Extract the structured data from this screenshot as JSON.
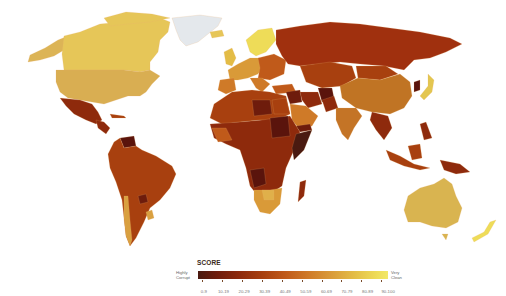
{
  "map": {
    "type": "choropleth",
    "subject": "Corruption score by country (world map)",
    "colors": {
      "0-9": "#4a1a10",
      "10-19": "#6e1c0c",
      "20-29": "#8e2a0c",
      "30-39": "#a8400f",
      "40-49": "#c05a1a",
      "50-59": "#cf7a28",
      "60-69": "#d99a38",
      "70-79": "#e3bc46",
      "80-89": "#eedc58",
      "90-100": "#f2e868",
      "no_data": "#e4e8ec"
    }
  },
  "legend": {
    "title": "SCORE",
    "left_label_line1": "Highly",
    "left_label_line2": "Corrupt",
    "right_label_line1": "Very",
    "right_label_line2": "Clean",
    "ranges": [
      "0-9",
      "10-19",
      "20-29",
      "30-39",
      "40-49",
      "50-59",
      "60-69",
      "70-79",
      "80-89",
      "90-100"
    ]
  }
}
